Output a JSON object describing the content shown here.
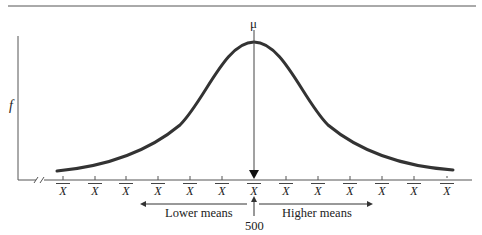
{
  "diagram": {
    "type": "normal-sampling-distribution",
    "mean_label": "μ",
    "y_axis_label": "f",
    "x_tick_label": "X̄",
    "x_tick_count": 13,
    "x_tick_labels": [
      "X",
      "X",
      "X",
      "X",
      "X",
      "X",
      "X",
      "X",
      "X",
      "X",
      "X",
      "X",
      "X"
    ],
    "left_arrow_label": "Lower means",
    "right_arrow_label": "Higher means",
    "center_value": "500",
    "axis_break": true,
    "colors": {
      "curve": "#333333",
      "axis": "#555555",
      "text": "#222222"
    }
  }
}
